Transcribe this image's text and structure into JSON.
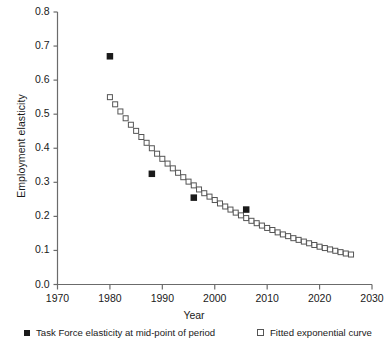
{
  "chart_data": {
    "type": "scatter",
    "title": "",
    "xlabel": "Year",
    "ylabel": "Employment elasticity",
    "xlim": [
      1970,
      2030
    ],
    "ylim": [
      0.0,
      0.8
    ],
    "grid": false,
    "xticks": [
      1970,
      1980,
      1990,
      2000,
      2010,
      2020,
      2030
    ],
    "xtick_labels": [
      "1970",
      "1980",
      "1990",
      "2000",
      "2010",
      "2020",
      "2030"
    ],
    "yticks": [
      0.0,
      0.1,
      0.2,
      0.3,
      0.4,
      0.5,
      0.6,
      0.7,
      0.8
    ],
    "ytick_labels": [
      "0.0",
      "0.1",
      "0.2",
      "0.3",
      "0.4",
      "0.5",
      "0.6",
      "0.7",
      "0.8"
    ],
    "legend_position": "below-axes",
    "series": [
      {
        "name": "Task Force elasticity at mid-point of period",
        "marker": "filled-square",
        "color": "#1a1a1a",
        "x": [
          1980,
          1988,
          1996,
          2006
        ],
        "y": [
          0.67,
          0.325,
          0.255,
          0.22
        ]
      },
      {
        "name": "Fitted exponential curve",
        "marker": "open-square",
        "color": "#555555",
        "x": [
          1980,
          1981,
          1982,
          1983,
          1984,
          1985,
          1986,
          1987,
          1988,
          1989,
          1990,
          1991,
          1992,
          1993,
          1994,
          1995,
          1996,
          1997,
          1998,
          1999,
          2000,
          2001,
          2002,
          2003,
          2004,
          2005,
          2006,
          2007,
          2008,
          2009,
          2010,
          2011,
          2012,
          2013,
          2014,
          2015,
          2016,
          2017,
          2018,
          2019,
          2020,
          2021,
          2022,
          2023,
          2024,
          2025,
          2026
        ],
        "y": [
          0.55,
          0.529,
          0.508,
          0.488,
          0.469,
          0.451,
          0.433,
          0.416,
          0.4,
          0.384,
          0.369,
          0.355,
          0.341,
          0.328,
          0.315,
          0.302,
          0.291,
          0.279,
          0.268,
          0.258,
          0.248,
          0.238,
          0.229,
          0.22,
          0.211,
          0.203,
          0.195,
          0.187,
          0.18,
          0.173,
          0.166,
          0.16,
          0.153,
          0.147,
          0.142,
          0.136,
          0.131,
          0.126,
          0.121,
          0.116,
          0.111,
          0.107,
          0.103,
          0.099,
          0.095,
          0.091,
          0.088
        ]
      }
    ]
  },
  "axis": {
    "xlabel": "Year",
    "ylabel": "Employment elasticity"
  },
  "legend": {
    "items": [
      {
        "label": "Task Force elasticity at mid-point of period",
        "marker": "filled-square-icon"
      },
      {
        "label": "Fitted exponential curve",
        "marker": "open-square-icon"
      }
    ]
  },
  "colors": {
    "axis": "#6b6b6b",
    "text": "#1a1a1a",
    "filled_marker": "#1a1a1a",
    "open_marker": "#555555",
    "background": "#ffffff"
  }
}
